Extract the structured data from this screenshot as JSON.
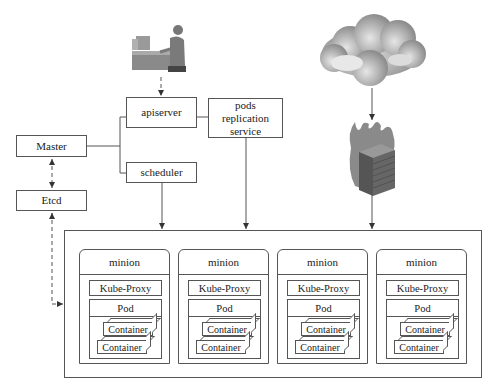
{
  "diagram": {
    "nodes": {
      "apiserver": "apiserver",
      "master": "Master",
      "scheduler": "scheduler",
      "etcd": "Etcd",
      "pods_replication_service": [
        "pods",
        "replication",
        "service"
      ]
    },
    "icons": {
      "user": "user-at-computer-icon",
      "cloud": "cloud-icon",
      "firewall": "firewall-icon"
    },
    "minions": [
      {
        "title": "minion",
        "proxy": "Kube-Proxy",
        "pod": "Pod",
        "containers": [
          "Container",
          "Container"
        ]
      },
      {
        "title": "minion",
        "proxy": "Kube-Proxy",
        "pod": "Pod",
        "containers": [
          "Container",
          "Container"
        ]
      },
      {
        "title": "minion",
        "proxy": "Kube-Proxy",
        "pod": "Pod",
        "containers": [
          "Container",
          "Container"
        ]
      },
      {
        "title": "minion",
        "proxy": "Kube-Proxy",
        "pod": "Pod",
        "containers": [
          "Container",
          "Container"
        ]
      }
    ],
    "colors": {
      "line": "#555555",
      "icon_gray": "#8a8a8a"
    }
  }
}
